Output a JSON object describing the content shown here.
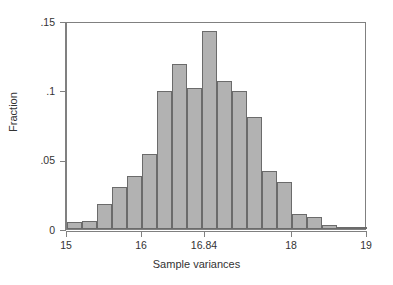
{
  "chart_data": {
    "type": "bar",
    "title": "",
    "subtitle": "",
    "xlabel": "Sample variances",
    "ylabel": "Fraction",
    "xlim": [
      15,
      19
    ],
    "ylim": [
      0,
      0.15
    ],
    "grid": false,
    "legend": null,
    "bin_width": 0.2,
    "x_tick_labels": [
      "15",
      "16",
      "16.84",
      "18",
      "19"
    ],
    "x_tick_values": [
      15,
      16,
      16.84,
      18,
      19
    ],
    "y_tick_labels": [
      "0",
      ".05",
      ".1",
      ".15"
    ],
    "y_tick_values": [
      0,
      0.05,
      0.1,
      0.15
    ],
    "bin_starts": [
      15.0,
      15.2,
      15.4,
      15.6,
      15.8,
      16.0,
      16.2,
      16.4,
      16.6,
      16.8,
      17.0,
      17.2,
      17.4,
      17.6,
      17.8,
      18.0,
      18.2,
      18.4,
      18.6,
      18.8
    ],
    "bin_ends": [
      15.2,
      15.4,
      15.6,
      15.8,
      16.0,
      16.2,
      16.4,
      16.6,
      16.8,
      17.0,
      17.2,
      17.4,
      17.6,
      17.8,
      18.0,
      18.2,
      18.4,
      18.6,
      18.8,
      19.0
    ],
    "categories": [
      "15.0-15.2",
      "15.2-15.4",
      "15.4-15.6",
      "15.6-15.8",
      "15.8-16.0",
      "16.0-16.2",
      "16.2-16.4",
      "16.4-16.6",
      "16.6-16.8",
      "16.8-17.0",
      "17.0-17.2",
      "17.2-17.4",
      "17.4-17.6",
      "17.6-17.8",
      "17.8-18.0",
      "18.0-18.2",
      "18.2-18.4",
      "18.4-18.6",
      "18.6-18.8",
      "18.8-19.0"
    ],
    "values": [
      0.005,
      0.006,
      0.018,
      0.03,
      0.038,
      0.054,
      0.0995,
      0.119,
      0.102,
      0.143,
      0.107,
      0.0995,
      0.081,
      0.042,
      0.034,
      0.011,
      0.009,
      0.003,
      0.001,
      0.001
    ],
    "bar_fill_color": "#b2b2b2",
    "bar_edge_color": "#6b6b6b",
    "frame_color": "#808080",
    "background_color": "#ffffff"
  }
}
